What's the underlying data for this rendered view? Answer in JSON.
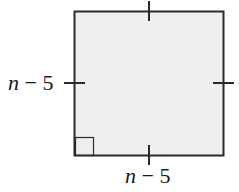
{
  "figure": {
    "shape": "square",
    "fill_color": "#efefef",
    "stroke_color": "#2a2a2a",
    "tick_marks": 4,
    "right_angle_marker": "bottom-left",
    "labels": {
      "left_side": {
        "var": "n",
        "rest": " − 5"
      },
      "bottom_side": {
        "var": "n",
        "rest": " − 5"
      }
    }
  }
}
